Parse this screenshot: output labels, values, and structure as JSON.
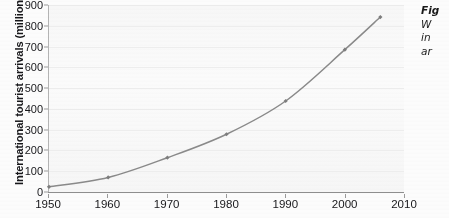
{
  "chart_data": {
    "type": "line",
    "title": "",
    "xlabel": "",
    "ylabel": "International tourist arrivals (millions)",
    "x": [
      1950,
      1960,
      1970,
      1980,
      1990,
      2000,
      2006
    ],
    "values": [
      25,
      70,
      165,
      278,
      438,
      685,
      842
    ],
    "series": [
      {
        "name": "International tourist arrivals",
        "values": [
          25,
          70,
          165,
          278,
          438,
          685,
          842
        ]
      }
    ],
    "xlim": [
      1950,
      2010
    ],
    "ylim": [
      0,
      900
    ],
    "x_ticks": [
      "1950",
      "1960",
      "1970",
      "1980",
      "1990",
      "2000",
      "2010"
    ],
    "x_tick_values": [
      1950,
      1960,
      1970,
      1980,
      1990,
      2000,
      2010
    ],
    "y_ticks": [
      "0",
      "100",
      "200",
      "300",
      "400",
      "500",
      "600",
      "700",
      "800",
      "900"
    ],
    "y_tick_values": [
      0,
      100,
      200,
      300,
      400,
      500,
      600,
      700,
      800,
      900
    ],
    "grid": true,
    "legend": "none",
    "line_color": "#8a8a8a",
    "marker_color": "#7d7d7d",
    "marker": "diamond",
    "plot_background": "#fafafa"
  },
  "caption": {
    "label": "Fig",
    "lines": [
      "W",
      "in",
      "ar"
    ]
  }
}
